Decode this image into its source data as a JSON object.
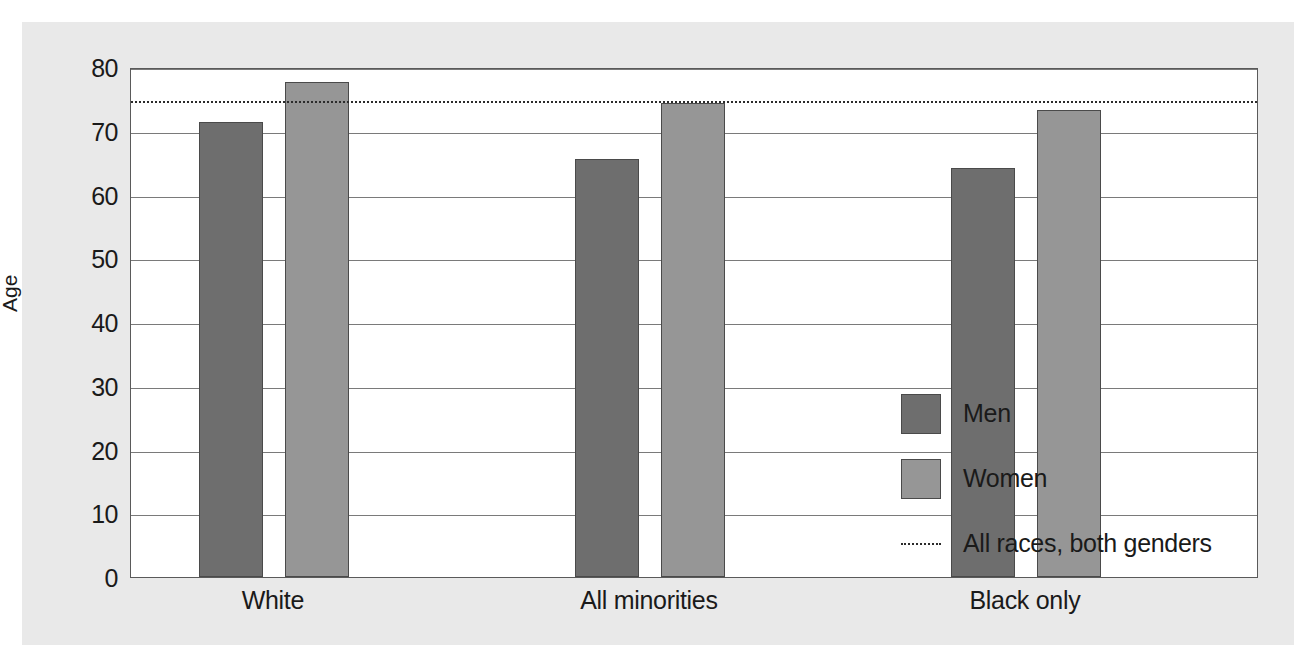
{
  "chart_data": {
    "type": "bar",
    "title": "",
    "xlabel": "",
    "ylabel": "Age",
    "ylim": [
      0,
      80
    ],
    "ytick_step": 10,
    "yticks": [
      "80",
      "70",
      "60",
      "50",
      "40",
      "30",
      "20",
      "10",
      "0"
    ],
    "grid": true,
    "legend_position": "inside-right",
    "categories": [
      "White",
      "All minorities",
      "Black only"
    ],
    "series": [
      {
        "name": "Men",
        "color": "#6e6e6e",
        "values": [
          71.4,
          65.5,
          64.1
        ]
      },
      {
        "name": "Women",
        "color": "#969696",
        "values": [
          77.6,
          74.3,
          73.2
        ]
      }
    ],
    "reference_line": {
      "label": "All races, both genders",
      "value": 75,
      "style": "dotted",
      "color": "#2b2b2b"
    },
    "annotations": []
  },
  "legend": {
    "items": [
      {
        "label": "Men",
        "marker": "swatch"
      },
      {
        "label": "Women",
        "marker": "swatch"
      },
      {
        "label": "All races, both genders",
        "marker": "dotted-line"
      }
    ]
  },
  "colors": {
    "men": "#6e6e6e",
    "women": "#969696",
    "panel": "#e9e9e9",
    "plot": "#ffffff",
    "grid": "#7a7a7a",
    "axis": "#5a5a5a",
    "text": "#1a1a1a"
  }
}
